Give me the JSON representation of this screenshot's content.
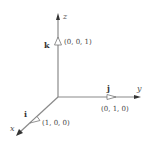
{
  "diagram": {
    "axes": {
      "x": {
        "label": "x"
      },
      "y": {
        "label": "y"
      },
      "z": {
        "label": "z"
      }
    },
    "vectors": [
      {
        "name": "i",
        "coords": "(1, 0, 0)"
      },
      {
        "name": "j",
        "coords": "(0, 1, 0)"
      },
      {
        "name": "k",
        "coords": "(0, 0, 1)"
      }
    ],
    "colors": {
      "axis": "#8a8a8a",
      "text": "#444444"
    }
  }
}
